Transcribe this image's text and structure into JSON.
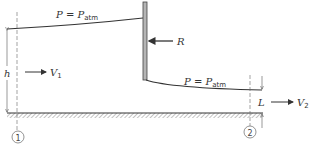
{
  "diagram": {
    "type": "fluid-flow-under-sluice-gate",
    "upstream_surface_label": {
      "symbol": "P",
      "eq": " = ",
      "rhs": "P",
      "rhs_sub": "atm"
    },
    "downstream_surface_label": {
      "symbol": "P",
      "eq": " = ",
      "rhs": "P",
      "rhs_sub": "atm"
    },
    "force_label": "R",
    "upstream_depth_label": "h",
    "upstream_velocity": {
      "symbol": "V",
      "sub": "1"
    },
    "downstream_depth_label": "L",
    "downstream_velocity": {
      "symbol": "V",
      "sub": "2"
    },
    "stations": [
      {
        "id": "1"
      },
      {
        "id": "2"
      }
    ],
    "colors": {
      "line": "#333333",
      "gate_fill": "#b5b5b5",
      "hatch": "#777777"
    }
  }
}
